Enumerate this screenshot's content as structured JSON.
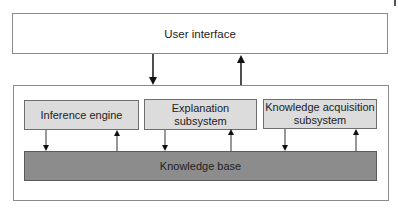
{
  "diagram": {
    "user_interface": {
      "label": "User interface"
    },
    "subsystems": [
      {
        "label": "Inference engine"
      },
      {
        "label": "Explanation\nsubsystem"
      },
      {
        "label": "Knowledge acquisition\nsubsystem"
      }
    ],
    "knowledge_base": {
      "label": "Knowledge base"
    },
    "colors": {
      "subsystem_fill": "#dcdcdc",
      "knowledge_base_fill": "#8c8c8c",
      "border": "#8a8a8a"
    },
    "edges": [
      {
        "from": "User interface",
        "to": "System",
        "direction": "down"
      },
      {
        "from": "System",
        "to": "User interface",
        "direction": "up"
      },
      {
        "from": "Inference engine",
        "to": "Knowledge base",
        "direction": "down"
      },
      {
        "from": "Knowledge base",
        "to": "Inference engine",
        "direction": "up"
      },
      {
        "from": "Explanation subsystem",
        "to": "Knowledge base",
        "direction": "down"
      },
      {
        "from": "Knowledge base",
        "to": "Explanation subsystem",
        "direction": "up"
      },
      {
        "from": "Knowledge acquisition subsystem",
        "to": "Knowledge base",
        "direction": "down"
      },
      {
        "from": "Knowledge base",
        "to": "Knowledge acquisition subsystem",
        "direction": "up"
      }
    ]
  }
}
